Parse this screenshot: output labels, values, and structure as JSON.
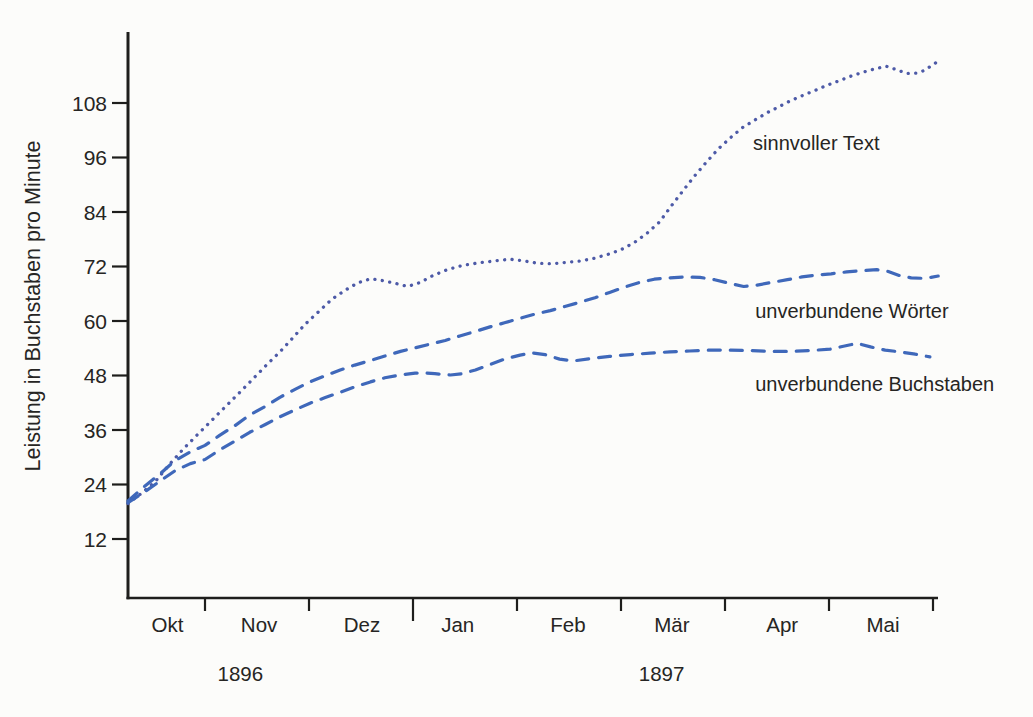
{
  "page": {
    "background": "#fcfcfa"
  },
  "chart_data": {
    "type": "line",
    "title": "",
    "xlabel": "",
    "ylabel": "Leistung in Buchstaben pro Minute",
    "grid": false,
    "legend_position": "inline-labels-right-of-curves",
    "axis_color": "#1e1e1c",
    "text_color": "#262523",
    "x_axis": {
      "unit": "Monate, Okt 1896 bis Mai 1897 (0 = Anfang Okt)",
      "months": [
        "Okt",
        "Nov",
        "Dez",
        "Jan",
        "Feb",
        "Mär",
        "Apr",
        "Mai"
      ],
      "month_label_x": [
        0.64,
        1.52,
        2.51,
        3.43,
        4.49,
        5.49,
        6.55,
        7.52
      ],
      "tick_positions": [
        1,
        2,
        3,
        4,
        5,
        6,
        7,
        8
      ],
      "year_boundary_tick": 3,
      "years": [
        {
          "label": "1896",
          "x": 1.34
        },
        {
          "label": "1897",
          "x": 5.39
        }
      ],
      "range": [
        0.26,
        8.05
      ]
    },
    "y_axis": {
      "ticks": [
        12,
        24,
        36,
        48,
        60,
        72,
        84,
        96,
        108
      ],
      "range": [
        0,
        124
      ]
    },
    "series": [
      {
        "name": "sinnvoller Text",
        "style": "dotted",
        "color": "#4d5aa7",
        "label": {
          "x": 6.27,
          "y": 97.7
        },
        "points": [
          [
            0.26,
            19.8
          ],
          [
            0.38,
            21.9
          ],
          [
            0.52,
            24.6
          ],
          [
            0.65,
            28.2
          ],
          [
            0.79,
            31.8
          ],
          [
            0.92,
            34.8
          ],
          [
            1.06,
            38.0
          ],
          [
            1.19,
            41.0
          ],
          [
            1.33,
            44.2
          ],
          [
            1.46,
            47.2
          ],
          [
            1.6,
            50.5
          ],
          [
            1.72,
            53.2
          ],
          [
            1.84,
            56.2
          ],
          [
            1.96,
            59.2
          ],
          [
            2.09,
            62.0
          ],
          [
            2.22,
            64.8
          ],
          [
            2.35,
            66.8
          ],
          [
            2.47,
            68.4
          ],
          [
            2.59,
            69.3
          ],
          [
            2.71,
            68.9
          ],
          [
            2.83,
            68.3
          ],
          [
            2.95,
            67.6
          ],
          [
            3.07,
            68.5
          ],
          [
            3.19,
            70.0
          ],
          [
            3.33,
            71.3
          ],
          [
            3.47,
            72.2
          ],
          [
            3.63,
            72.8
          ],
          [
            3.78,
            73.2
          ],
          [
            3.93,
            73.6
          ],
          [
            4.07,
            73.2
          ],
          [
            4.2,
            72.7
          ],
          [
            4.34,
            72.6
          ],
          [
            4.47,
            72.9
          ],
          [
            4.61,
            73.2
          ],
          [
            4.74,
            73.8
          ],
          [
            4.88,
            74.7
          ],
          [
            5.0,
            75.7
          ],
          [
            5.13,
            77.3
          ],
          [
            5.25,
            79.3
          ],
          [
            5.37,
            81.8
          ],
          [
            5.48,
            85.2
          ],
          [
            5.6,
            88.8
          ],
          [
            5.71,
            92.0
          ],
          [
            5.83,
            95.2
          ],
          [
            5.94,
            98.0
          ],
          [
            6.06,
            100.5
          ],
          [
            6.17,
            102.6
          ],
          [
            6.29,
            104.3
          ],
          [
            6.4,
            105.8
          ],
          [
            6.52,
            107.2
          ],
          [
            6.63,
            108.5
          ],
          [
            6.75,
            109.7
          ],
          [
            6.87,
            110.8
          ],
          [
            6.98,
            111.9
          ],
          [
            7.1,
            112.9
          ],
          [
            7.21,
            113.9
          ],
          [
            7.33,
            114.8
          ],
          [
            7.44,
            115.5
          ],
          [
            7.55,
            116.1
          ],
          [
            7.65,
            115.3
          ],
          [
            7.75,
            114.5
          ],
          [
            7.85,
            114.6
          ],
          [
            7.92,
            115.2
          ],
          [
            7.99,
            116.3
          ],
          [
            8.05,
            117.2
          ]
        ]
      },
      {
        "name": "unverbundene Wörter",
        "style": "dashed",
        "color": "#3f68ba",
        "label": {
          "x": 6.29,
          "y": 60.7
        },
        "points": [
          [
            0.26,
            20.4
          ],
          [
            0.42,
            23.6
          ],
          [
            0.57,
            26.4
          ],
          [
            0.71,
            29.2
          ],
          [
            0.86,
            31.2
          ],
          [
            1.0,
            32.6
          ],
          [
            1.14,
            34.8
          ],
          [
            1.29,
            37.0
          ],
          [
            1.43,
            39.3
          ],
          [
            1.58,
            41.2
          ],
          [
            1.72,
            43.2
          ],
          [
            1.87,
            45.0
          ],
          [
            2.01,
            46.6
          ],
          [
            2.15,
            47.9
          ],
          [
            2.3,
            49.2
          ],
          [
            2.44,
            50.3
          ],
          [
            2.59,
            51.3
          ],
          [
            2.73,
            52.3
          ],
          [
            2.88,
            53.3
          ],
          [
            3.02,
            54.1
          ],
          [
            3.16,
            54.9
          ],
          [
            3.31,
            55.7
          ],
          [
            3.45,
            56.7
          ],
          [
            3.6,
            57.7
          ],
          [
            3.74,
            58.7
          ],
          [
            3.88,
            59.6
          ],
          [
            4.03,
            60.6
          ],
          [
            4.17,
            61.5
          ],
          [
            4.32,
            62.3
          ],
          [
            4.46,
            63.2
          ],
          [
            4.6,
            64.1
          ],
          [
            4.75,
            65.1
          ],
          [
            4.89,
            66.3
          ],
          [
            5.04,
            67.5
          ],
          [
            5.18,
            68.5
          ],
          [
            5.32,
            69.2
          ],
          [
            5.47,
            69.5
          ],
          [
            5.61,
            69.7
          ],
          [
            5.76,
            69.6
          ],
          [
            5.9,
            69.1
          ],
          [
            6.04,
            68.3
          ],
          [
            6.18,
            67.6
          ],
          [
            6.31,
            67.9
          ],
          [
            6.45,
            68.5
          ],
          [
            6.6,
            69.1
          ],
          [
            6.74,
            69.7
          ],
          [
            6.88,
            70.1
          ],
          [
            7.02,
            70.4
          ],
          [
            7.17,
            70.8
          ],
          [
            7.31,
            71.1
          ],
          [
            7.46,
            71.3
          ],
          [
            7.57,
            70.9
          ],
          [
            7.68,
            70.0
          ],
          [
            7.79,
            69.5
          ],
          [
            7.9,
            69.4
          ],
          [
            7.98,
            69.6
          ],
          [
            8.05,
            69.9
          ]
        ]
      },
      {
        "name": "unverbundene Buchstaben",
        "style": "dashed",
        "color": "#3f68ba",
        "label": {
          "x": 6.29,
          "y": 44.6
        },
        "points": [
          [
            0.26,
            20.0
          ],
          [
            0.42,
            22.4
          ],
          [
            0.57,
            24.8
          ],
          [
            0.71,
            27.0
          ],
          [
            0.86,
            28.6
          ],
          [
            1.0,
            29.5
          ],
          [
            1.14,
            31.6
          ],
          [
            1.29,
            33.6
          ],
          [
            1.43,
            35.5
          ],
          [
            1.58,
            37.2
          ],
          [
            1.72,
            38.9
          ],
          [
            1.87,
            40.5
          ],
          [
            2.01,
            41.9
          ],
          [
            2.15,
            43.1
          ],
          [
            2.3,
            44.3
          ],
          [
            2.44,
            45.5
          ],
          [
            2.59,
            46.6
          ],
          [
            2.73,
            47.5
          ],
          [
            2.88,
            48.1
          ],
          [
            3.02,
            48.5
          ],
          [
            3.11,
            48.6
          ],
          [
            3.21,
            48.4
          ],
          [
            3.36,
            48.1
          ],
          [
            3.47,
            48.4
          ],
          [
            3.6,
            49.2
          ],
          [
            3.74,
            50.4
          ],
          [
            3.88,
            51.6
          ],
          [
            4.03,
            52.5
          ],
          [
            4.14,
            53.0
          ],
          [
            4.27,
            52.6
          ],
          [
            4.41,
            51.6
          ],
          [
            4.54,
            51.2
          ],
          [
            4.7,
            51.7
          ],
          [
            4.89,
            52.2
          ],
          [
            5.09,
            52.6
          ],
          [
            5.28,
            52.9
          ],
          [
            5.47,
            53.2
          ],
          [
            5.66,
            53.4
          ],
          [
            5.86,
            53.6
          ],
          [
            6.05,
            53.6
          ],
          [
            6.24,
            53.5
          ],
          [
            6.43,
            53.3
          ],
          [
            6.63,
            53.3
          ],
          [
            6.82,
            53.5
          ],
          [
            7.01,
            53.8
          ],
          [
            7.15,
            54.5
          ],
          [
            7.27,
            55.1
          ],
          [
            7.4,
            54.3
          ],
          [
            7.54,
            53.6
          ],
          [
            7.68,
            53.2
          ],
          [
            7.83,
            52.7
          ],
          [
            7.97,
            52.1
          ]
        ]
      }
    ]
  }
}
